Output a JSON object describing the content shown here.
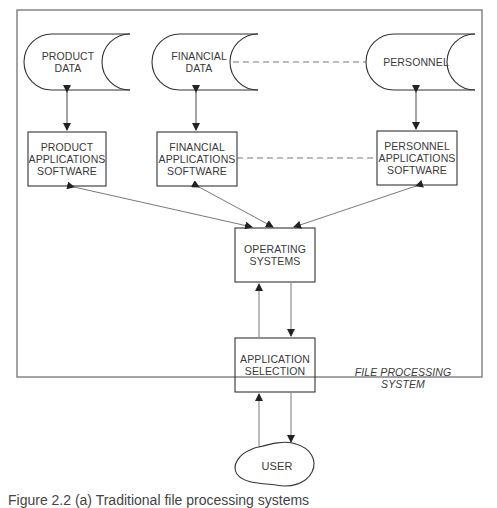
{
  "diagram": {
    "system_label": [
      "FILE PROCESSING",
      "SYSTEM"
    ],
    "data_stores": [
      {
        "id": "product-data",
        "lines": [
          "PRODUCT",
          "DATA"
        ]
      },
      {
        "id": "financial-data",
        "lines": [
          "FINANCIAL",
          "DATA"
        ]
      },
      {
        "id": "personnel-data",
        "lines": [
          "PERSONNEL"
        ]
      }
    ],
    "applications": [
      {
        "id": "product-apps",
        "lines": [
          "PRODUCT",
          "APPLICATIONS",
          "SOFTWARE"
        ]
      },
      {
        "id": "financial-apps",
        "lines": [
          "FINANCIAL",
          "APPLICATIONS",
          "SOFTWARE"
        ]
      },
      {
        "id": "personnel-apps",
        "lines": [
          "PERSONNEL",
          "APPLICATIONS",
          "SOFTWARE"
        ]
      }
    ],
    "operating_systems": {
      "lines": [
        "OPERATING",
        "SYSTEMS"
      ]
    },
    "application_selection": {
      "lines": [
        "APPLICATION",
        "SELECTION"
      ]
    },
    "user": {
      "label": "USER"
    },
    "caption": "Figure 2.2 (a) Traditional file processing systems"
  }
}
